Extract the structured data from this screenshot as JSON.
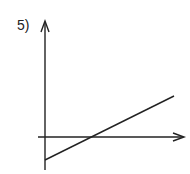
{
  "problem": {
    "number_label": "5)"
  },
  "diagram": {
    "type": "coordinate-axes-with-line",
    "stroke_color": "#222222",
    "y_axis": {
      "x": 45,
      "y_top": 22,
      "y_bottom": 170
    },
    "x_axis": {
      "y": 137,
      "x_left": 38,
      "x_right": 184
    },
    "line": {
      "x1": 45,
      "y1": 160,
      "x2": 174,
      "y2": 96
    }
  }
}
